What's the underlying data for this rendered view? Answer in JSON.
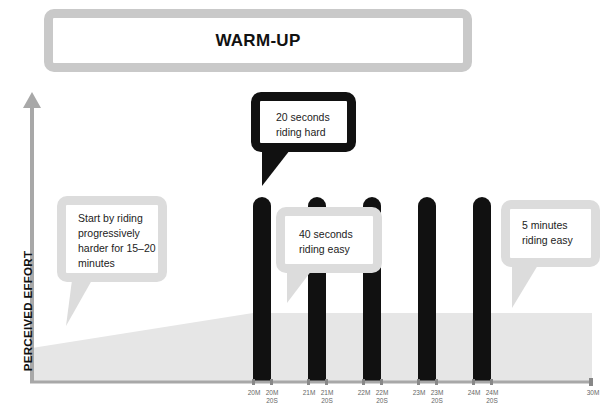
{
  "title": "WARM-UP",
  "y_axis_label": "PERCEIVED EFFORT",
  "bubbles": {
    "warmup": "Start by riding progressively harder for 15–20 minutes",
    "hard": "20 seconds riding hard",
    "easy40": "40 seconds riding easy",
    "easy5": "5 minutes riding easy"
  },
  "ticks": [
    {
      "label": "20M",
      "x": 253
    },
    {
      "label": "20M 20S",
      "x": 271
    },
    {
      "label": "21M",
      "x": 308
    },
    {
      "label": "21M 20S",
      "x": 326
    },
    {
      "label": "22M",
      "x": 363
    },
    {
      "label": "22M 20S",
      "x": 381
    },
    {
      "label": "23M",
      "x": 418
    },
    {
      "label": "23M 20S",
      "x": 436
    },
    {
      "label": "24M",
      "x": 473
    },
    {
      "label": "24M 20S",
      "x": 491
    },
    {
      "label": "30M",
      "x": 592
    }
  ],
  "colors": {
    "axis": "#a8a8a8",
    "fill": "#e6e6e6",
    "bar": "#111111",
    "bubble_light": "#dcdcdc",
    "title_border": "#c9c9c9"
  },
  "chart_data": {
    "type": "area",
    "title": "WARM-UP",
    "xlabel": "",
    "ylabel": "PERCEIVED EFFORT",
    "x_ticks": [
      "20M",
      "20M 20S",
      "21M",
      "21M 20S",
      "22M",
      "22M 20S",
      "23M",
      "23M 20S",
      "24M",
      "24M 20S",
      "30M"
    ],
    "segments": [
      {
        "name": "Warm-up (progressive)",
        "start_min": 0,
        "end_min": 20,
        "effort": "rising low to moderate"
      },
      {
        "name": "Hard interval 1",
        "start_min": 20,
        "end_min": 20.33,
        "effort": "high"
      },
      {
        "name": "Easy interval 1",
        "start_min": 20.33,
        "end_min": 21,
        "effort": "moderate"
      },
      {
        "name": "Hard interval 2",
        "start_min": 21,
        "end_min": 21.33,
        "effort": "high"
      },
      {
        "name": "Easy interval 2",
        "start_min": 21.33,
        "end_min": 22,
        "effort": "moderate"
      },
      {
        "name": "Hard interval 3",
        "start_min": 22,
        "end_min": 22.33,
        "effort": "high"
      },
      {
        "name": "Easy interval 3",
        "start_min": 22.33,
        "end_min": 23,
        "effort": "moderate"
      },
      {
        "name": "Hard interval 4",
        "start_min": 23,
        "end_min": 23.33,
        "effort": "high"
      },
      {
        "name": "Easy interval 4",
        "start_min": 23.33,
        "end_min": 24,
        "effort": "moderate"
      },
      {
        "name": "Hard interval 5",
        "start_min": 24,
        "end_min": 24.33,
        "effort": "high"
      },
      {
        "name": "Recovery easy",
        "start_min": 24.33,
        "end_min": 30,
        "effort": "moderate"
      }
    ],
    "annotations": [
      "Start by riding progressively harder for 15–20 minutes",
      "20 seconds riding hard",
      "40 seconds riding easy",
      "5 minutes riding easy"
    ]
  }
}
